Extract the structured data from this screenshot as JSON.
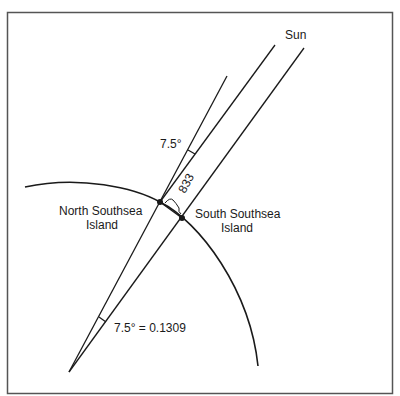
{
  "diagram": {
    "labels": {
      "sun": "Sun",
      "angle_top": "7.5°",
      "distance": "833",
      "north_island_line1": "North Southsea",
      "north_island_line2": "Island",
      "south_island_line1": "South Southsea",
      "south_island_line2": "Island",
      "angle_bottom": "7.5° = 0.1309"
    },
    "colors": {
      "line": "#1a1a1a",
      "frame": "#555555",
      "background": "#ffffff"
    }
  }
}
